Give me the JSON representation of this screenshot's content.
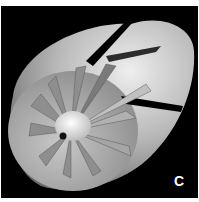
{
  "figure": {
    "panel_label": "C",
    "colors": {
      "background": "#000000",
      "nacelle": "#bdbdbd",
      "blade": "#9a9a9a",
      "hub": "#f2f2f2"
    }
  }
}
